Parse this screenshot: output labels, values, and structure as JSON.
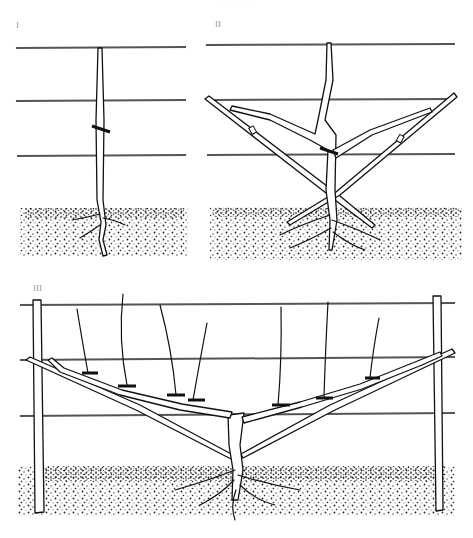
{
  "figure": {
    "header_text": "· · · ·",
    "panels": [
      {
        "id": "panel-1",
        "label": "I",
        "description": "Young vine single stem tied to stake, three trellis wires"
      },
      {
        "id": "panel-2",
        "label": "II",
        "description": "Vine with two angled arms tied to diagonal canes"
      },
      {
        "id": "panel-3",
        "label": "III",
        "description": "Established espalier with posts, two horizontal arms and vertical shoots"
      }
    ],
    "colors": {
      "ink": "#111111",
      "wire": "#555555",
      "background": "#ffffff"
    }
  }
}
